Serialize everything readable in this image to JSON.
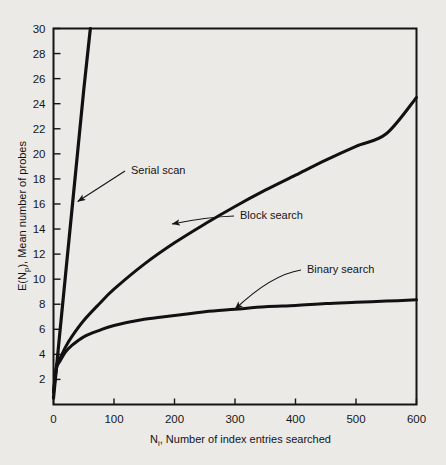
{
  "figure": {
    "background_color": "#eceae7",
    "ink_color": "#121212",
    "x_axis_title": "N i , Number of index entries searched",
    "x_axis_title_main": "N",
    "x_axis_title_sub": "i",
    "x_axis_title_rest": ", Number of index entries searched",
    "y_axis_title_pre": "E(N",
    "y_axis_title_sub": "p",
    "y_axis_title_post": "), Mean number of probes"
  },
  "chart_data": {
    "type": "line",
    "title": "",
    "xlabel": "N_i, Number of index entries searched",
    "ylabel": "E(N_p), Mean number of probes",
    "xlim": [
      0,
      600
    ],
    "ylim": [
      0,
      30
    ],
    "grid": false,
    "legend": "annotations-on-plot",
    "xticks": [
      0,
      100,
      200,
      300,
      400,
      500,
      600
    ],
    "xtick_labels": [
      "0",
      "100",
      "200",
      "300",
      "400",
      "500",
      "600"
    ],
    "yticks": [
      2,
      4,
      6,
      8,
      10,
      12,
      14,
      16,
      18,
      20,
      22,
      24,
      26,
      28,
      30
    ],
    "ytick_labels": [
      "2",
      "4",
      "6",
      "8",
      "10",
      "12",
      "14",
      "16",
      "18",
      "20",
      "22",
      "24",
      "26",
      "28",
      "30"
    ],
    "series": [
      {
        "name": "Serial scan",
        "x": [
          0,
          10,
          20,
          30,
          40,
          50,
          60,
          61
        ],
        "values": [
          0.5,
          5.5,
          10.4,
          15.3,
          20.2,
          25.1,
          29.6,
          30.0
        ],
        "note": "linear, leaves top of frame near N=61"
      },
      {
        "name": "Block search",
        "x": [
          0,
          5,
          10,
          20,
          30,
          50,
          75,
          100,
          150,
          200,
          250,
          300,
          350,
          400,
          450,
          500,
          550,
          600
        ],
        "values": [
          1.0,
          3.1,
          3.6,
          4.6,
          5.4,
          6.7,
          8.0,
          9.2,
          11.2,
          12.9,
          14.4,
          15.8,
          17.1,
          18.3,
          19.5,
          20.6,
          21.6,
          24.5
        ]
      },
      {
        "name": "Binary search",
        "x": [
          0,
          5,
          10,
          20,
          30,
          50,
          75,
          100,
          150,
          200,
          250,
          300,
          350,
          400,
          450,
          500,
          550,
          600
        ],
        "values": [
          1.0,
          2.9,
          3.4,
          4.2,
          4.7,
          5.4,
          5.9,
          6.3,
          6.8,
          7.1,
          7.4,
          7.6,
          7.8,
          7.9,
          8.05,
          8.15,
          8.25,
          8.35
        ]
      }
    ],
    "annotations": [
      {
        "label": "Serial scan",
        "label_x_px": 131,
        "label_y_px": 174,
        "arrow_style": "straight",
        "points_to_x": 40,
        "points_to_y": 16.2
      },
      {
        "label": "Block search",
        "label_x_px": 240,
        "label_y_px": 219,
        "arrow_style": "curved",
        "points_to_x": 196,
        "points_to_y": 14.4
      },
      {
        "label": "Binary search",
        "label_x_px": 307,
        "label_y_px": 273,
        "arrow_style": "curved",
        "points_to_x": 300,
        "points_to_y": 7.6
      }
    ]
  }
}
